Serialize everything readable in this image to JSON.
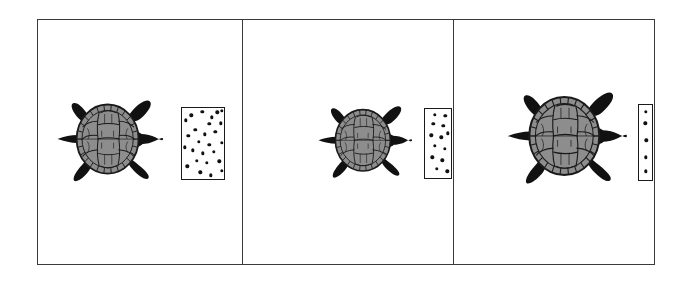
{
  "figure": {
    "type": "scientific-illustration",
    "panel_count": 3,
    "background_color": "#ffffff",
    "frame": {
      "stroke_color": "#3a3a3a",
      "stroke_width": 1.4,
      "x": 37,
      "y": 19,
      "width": 618,
      "height": 246
    },
    "dividers_x": [
      241,
      452
    ]
  },
  "colors": {
    "outline": "#1a1a1a",
    "frame_stroke": "#3a3a3a",
    "shell_fill": "#8d8d8d",
    "shell_scute_line": "#1a1a1a",
    "shell_scute_light": "#a2a2a2",
    "limb_fill": "#111111",
    "dot_fill": "#111111",
    "paper": "#ffffff"
  },
  "panels": [
    {
      "id": "panel-1",
      "label": "left-panel",
      "x": 38,
      "width": 203,
      "turtle": {
        "name": "turtle-dorsal-view",
        "orientation": "facing-right",
        "center_x": 108,
        "center_y": 139,
        "scale": 1.0,
        "shell_width": 62,
        "shell_height": 72
      },
      "dotfield": {
        "name": "dot-stimulus-field",
        "x": 181,
        "y": 107,
        "width": 44,
        "height": 73,
        "density": "high",
        "dot_count": 26,
        "dot_radius": 1.7,
        "dots": [
          [
            0.21,
            0.1
          ],
          [
            0.46,
            0.05
          ],
          [
            0.68,
            0.13
          ],
          [
            0.8,
            0.06
          ],
          [
            0.9,
            0.04
          ],
          [
            0.09,
            0.17
          ],
          [
            0.62,
            0.22
          ],
          [
            0.88,
            0.21
          ],
          [
            0.3,
            0.3
          ],
          [
            0.14,
            0.38
          ],
          [
            0.52,
            0.36
          ],
          [
            0.76,
            0.33
          ],
          [
            0.38,
            0.46
          ],
          [
            0.62,
            0.5
          ],
          [
            0.9,
            0.48
          ],
          [
            0.07,
            0.54
          ],
          [
            0.24,
            0.58
          ],
          [
            0.47,
            0.62
          ],
          [
            0.72,
            0.6
          ],
          [
            0.33,
            0.72
          ],
          [
            0.57,
            0.75
          ],
          [
            0.85,
            0.73
          ],
          [
            0.12,
            0.8
          ],
          [
            0.42,
            0.88
          ],
          [
            0.66,
            0.92
          ],
          [
            0.9,
            0.86
          ]
        ]
      }
    },
    {
      "id": "panel-2",
      "label": "middle-panel",
      "x": 242,
      "width": 210,
      "turtle": {
        "name": "turtle-dorsal-view",
        "orientation": "facing-right",
        "center_x": 363,
        "center_y": 140,
        "scale": 0.88,
        "shell_width": 55,
        "shell_height": 63
      },
      "dotfield": {
        "name": "dot-stimulus-field",
        "x": 424,
        "y": 108,
        "width": 28,
        "height": 71,
        "density": "medium",
        "dot_count": 13,
        "dot_radius": 1.7,
        "dots": [
          [
            0.36,
            0.08
          ],
          [
            0.72,
            0.1
          ],
          [
            0.3,
            0.21
          ],
          [
            0.66,
            0.24
          ],
          [
            0.22,
            0.37
          ],
          [
            0.58,
            0.4
          ],
          [
            0.82,
            0.34
          ],
          [
            0.34,
            0.52
          ],
          [
            0.7,
            0.56
          ],
          [
            0.26,
            0.68
          ],
          [
            0.62,
            0.72
          ],
          [
            0.42,
            0.84
          ],
          [
            0.8,
            0.88
          ]
        ]
      }
    },
    {
      "id": "panel-3",
      "label": "right-panel",
      "x": 453,
      "width": 202,
      "turtle": {
        "name": "turtle-dorsal-view",
        "orientation": "facing-right",
        "center_x": 564,
        "center_y": 136,
        "scale": 1.12,
        "shell_width": 70,
        "shell_height": 80
      },
      "dotfield": {
        "name": "dot-stimulus-field",
        "x": 638,
        "y": 104,
        "width": 15,
        "height": 77,
        "density": "low",
        "dot_count": 5,
        "dot_radius": 1.7,
        "dots": [
          [
            0.45,
            0.09
          ],
          [
            0.42,
            0.24
          ],
          [
            0.48,
            0.46
          ],
          [
            0.45,
            0.68
          ],
          [
            0.44,
            0.86
          ]
        ]
      }
    }
  ]
}
